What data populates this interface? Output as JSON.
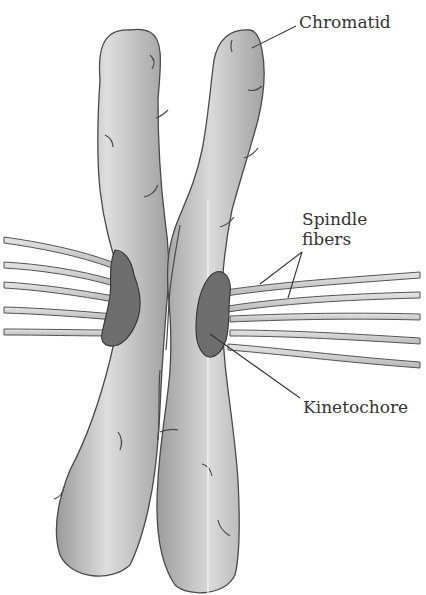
{
  "diagram": {
    "labels": {
      "chromatid": "Chromatid",
      "spindle_fibers_line1": "Spindle",
      "spindle_fibers_line2": "fibers",
      "kinetochore": "Kinetochore"
    },
    "colors": {
      "background": "#ffffff",
      "chromatid_fill": "#b8b8b8",
      "chromatid_highlight": "#dcdcdc",
      "chromatid_outline": "#4a4a4a",
      "kinetochore_fill": "#6e6e6e",
      "fiber_fill": "#c8c8c8",
      "fiber_outline": "#555555",
      "leader_line": "#333333",
      "text": "#333333"
    }
  }
}
